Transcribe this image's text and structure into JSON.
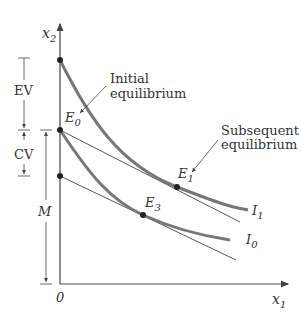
{
  "diagram": {
    "axes": {
      "y_label": "x",
      "y_label_sub": "2",
      "x_label": "x",
      "x_label_sub": "1",
      "origin_label": "0"
    },
    "curves": {
      "i1_label": "I",
      "i1_sub": "1",
      "i0_label": "I",
      "i0_sub": "0"
    },
    "points": {
      "e0_label": "E",
      "e0_sub": "0",
      "e1_label": "E",
      "e1_sub": "1",
      "e3_label": "E",
      "e3_sub": "3"
    },
    "annotations": {
      "initial_line1": "Initial",
      "initial_line2": "equilibrium",
      "subsequent_line1": "Subsequent",
      "subsequent_line2": "equilibrium"
    },
    "brackets": {
      "ev": "EV",
      "cv": "CV",
      "m": "M"
    },
    "colors": {
      "curve": "#777777",
      "line": "#444444",
      "text": "#333333"
    }
  }
}
